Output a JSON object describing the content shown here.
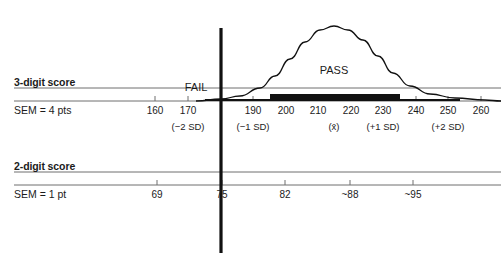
{
  "figure": {
    "background_color": "#ffffff",
    "ink_color": "#1b1b1b",
    "axis_color": "#6f6f6f",
    "cutline_color": "#111111"
  },
  "rows": [
    {
      "id": "three-digit",
      "title": "3-digit score",
      "subtitle": "SEM = 4 pts",
      "axis_y": 101,
      "ticks": [
        {
          "value": "160",
          "x": 155
        },
        {
          "value": "170",
          "x": 188
        },
        {
          "value": "190",
          "x": 253
        },
        {
          "value": "200",
          "x": 286
        },
        {
          "value": "210",
          "x": 318
        },
        {
          "value": "220",
          "x": 351
        },
        {
          "value": "230",
          "x": 383
        },
        {
          "value": "240",
          "x": 416
        },
        {
          "value": "250",
          "x": 448
        },
        {
          "value": "260",
          "x": 481
        }
      ],
      "sd_labels": [
        {
          "text": "(−2 SD)",
          "x": 188
        },
        {
          "text": "(−1 SD)",
          "x": 253
        },
        {
          "text": "(x̄)",
          "x": 334
        },
        {
          "text": "(+1 SD)",
          "x": 383
        },
        {
          "text": "(+2 SD)",
          "x": 448
        }
      ]
    },
    {
      "id": "two-digit",
      "title": "2-digit score",
      "subtitle": "SEM = 1 pt",
      "axis_y": 185,
      "ticks": [
        {
          "value": "69",
          "x": 157
        },
        {
          "value": "75",
          "x": 222
        },
        {
          "value": "82",
          "x": 285
        },
        {
          "value": "~88",
          "x": 350
        },
        {
          "value": "~95",
          "x": 413
        }
      ],
      "sd_labels": []
    }
  ],
  "zones": [
    {
      "label": "FAIL",
      "x": 196,
      "y": 81
    },
    {
      "label": "PASS",
      "x": 334,
      "y": 64
    }
  ],
  "cut_line": {
    "label": "passing-cut-score-line",
    "x": 221,
    "y_top": 28,
    "y_bottom": 253
  },
  "distribution_bar": {
    "thin_segment": {
      "x_start": 205,
      "x_end": 460,
      "thickness": 2
    },
    "thick_segment": {
      "x_start": 270,
      "x_end": 400,
      "thickness": 7
    }
  },
  "chart_data": {
    "type": "line",
    "xlabel": "",
    "ylabel": "",
    "grid": false,
    "legend": null,
    "axes": [
      {
        "name": "3-digit score",
        "annotation": "SEM = 4 pts",
        "tick_values": [
          160,
          170,
          180,
          190,
          200,
          210,
          220,
          230,
          240,
          250,
          260
        ],
        "tick_labels": [
          "160",
          "170",
          "",
          "190",
          "200",
          "210",
          "220",
          "230",
          "240",
          "250",
          "260"
        ],
        "sd_markers": {
          "−2 SD": 170,
          "−1 SD": 190,
          "mean": 215,
          "+1 SD": 230,
          "+2 SD": 250
        },
        "range": [
          155,
          263
        ]
      },
      {
        "name": "2-digit score",
        "annotation": "SEM = 1 pt",
        "tick_values": [
          69,
          75,
          82,
          88,
          95
        ],
        "tick_labels": [
          "69",
          "75",
          "82",
          "~88",
          "~95"
        ],
        "range": [
          67,
          98
        ]
      }
    ],
    "cut_score": {
      "three_digit": 182,
      "two_digit": 75,
      "left_region": "FAIL",
      "right_region": "PASS"
    },
    "distribution": {
      "shape": "normal bell curve",
      "mean_three_digit": 215,
      "sd_three_digit": 20,
      "peak_x_px": 334,
      "curve_points": [
        {
          "x": 221,
          "y": 99
        },
        {
          "x": 240,
          "y": 96
        },
        {
          "x": 260,
          "y": 88
        },
        {
          "x": 275,
          "y": 76
        },
        {
          "x": 290,
          "y": 59
        },
        {
          "x": 305,
          "y": 42
        },
        {
          "x": 320,
          "y": 30
        },
        {
          "x": 334,
          "y": 26
        },
        {
          "x": 348,
          "y": 30
        },
        {
          "x": 363,
          "y": 40
        },
        {
          "x": 378,
          "y": 56
        },
        {
          "x": 393,
          "y": 73
        },
        {
          "x": 410,
          "y": 86
        },
        {
          "x": 430,
          "y": 94
        },
        {
          "x": 455,
          "y": 98
        },
        {
          "x": 485,
          "y": 100
        }
      ]
    }
  }
}
